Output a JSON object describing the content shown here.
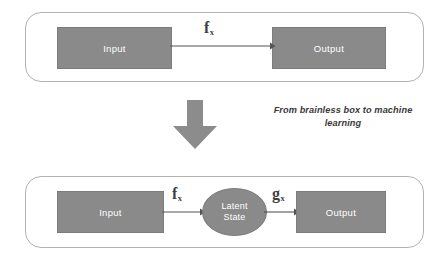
{
  "diagram": {
    "title": "From brainless box to machine learning",
    "background_color": "#ffffff",
    "box_fill_color": "#8a8a8a",
    "box_text_color": "#ffffff",
    "panel_border_color": "#b2b2b2",
    "arrow_color": "#4a4a4a",
    "transition_arrow_color": "#8a8a8a"
  },
  "top_panel": {
    "input_box": {
      "label": "Input"
    },
    "output_box": {
      "label": "Output"
    },
    "connector": {
      "function_label": "f",
      "function_subscript": "x",
      "direction": "right"
    }
  },
  "transition": {
    "arrow_icon": "down-arrow-icon",
    "caption_line_1": "From brainless box to machine",
    "caption_line_2": "learning"
  },
  "bottom_panel": {
    "input_box": {
      "label": "Input"
    },
    "latent_state": {
      "label_line_1": "Latent",
      "label_line_2": "State"
    },
    "output_box": {
      "label": "Output"
    },
    "connector_1": {
      "function_label": "f",
      "function_subscript": "x",
      "direction": "right"
    },
    "connector_2": {
      "function_label": "g",
      "function_subscript": "x",
      "direction": "right"
    }
  }
}
